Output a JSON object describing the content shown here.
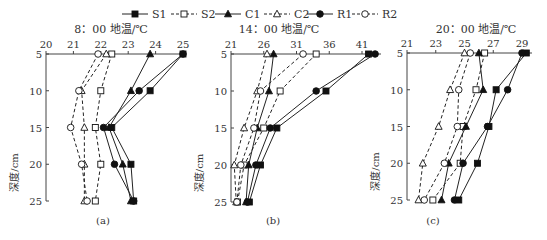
{
  "legend": [
    {
      "name": "S1",
      "marker": "square-filled",
      "dash": false
    },
    {
      "name": "S2",
      "marker": "square-open",
      "dash": true
    },
    {
      "name": "C1",
      "marker": "triangle-filled",
      "dash": false
    },
    {
      "name": "C2",
      "marker": "triangle-open",
      "dash": true
    },
    {
      "name": "R1",
      "marker": "circle-filled",
      "dash": false
    },
    {
      "name": "R2",
      "marker": "circle-open",
      "dash": true
    }
  ],
  "ylabel": "深度/cm",
  "chart_data": [
    {
      "type": "line",
      "caption": "(a)",
      "title": "8：00 地温/℃",
      "xlabel": "地温/℃",
      "ylabel": "深度/cm",
      "x_ticks": [
        20,
        21,
        22,
        23,
        24,
        25
      ],
      "xlim": [
        20,
        25
      ],
      "y_ticks": [
        5,
        10,
        15,
        20,
        25
      ],
      "ylim": [
        5,
        25
      ],
      "depths": [
        5,
        10,
        15,
        20,
        25
      ],
      "series": [
        {
          "name": "S1",
          "values": [
            25.0,
            23.8,
            22.4,
            23.1,
            23.2
          ]
        },
        {
          "name": "S2",
          "values": [
            22.4,
            22.0,
            21.8,
            22.0,
            21.8
          ]
        },
        {
          "name": "C1",
          "values": [
            23.8,
            23.1,
            22.3,
            22.8,
            23.1
          ]
        },
        {
          "name": "C2",
          "values": [
            22.2,
            21.3,
            21.4,
            21.4,
            21.4
          ]
        },
        {
          "name": "R1",
          "values": [
            25.0,
            23.4,
            22.1,
            22.5,
            23.2
          ]
        },
        {
          "name": "R2",
          "values": [
            21.9,
            21.2,
            20.9,
            21.3,
            21.5
          ]
        }
      ]
    },
    {
      "type": "line",
      "caption": "(b)",
      "title": "14：00 地温/℃",
      "xlabel": "地温/℃",
      "ylabel": "深度/cm",
      "x_ticks": [
        21,
        26,
        31,
        36,
        41
      ],
      "xlim": [
        21,
        44
      ],
      "y_ticks": [
        5,
        10,
        15,
        20,
        25
      ],
      "ylim": [
        5,
        25
      ],
      "depths": [
        5,
        10,
        15,
        20,
        25
      ],
      "series": [
        {
          "name": "S1",
          "values": [
            42.0,
            35.5,
            28.0,
            25.5,
            23.8
          ]
        },
        {
          "name": "S2",
          "values": [
            34.0,
            28.5,
            26.0,
            23.0,
            22.0
          ]
        },
        {
          "name": "C1",
          "values": [
            27.5,
            26.8,
            25.0,
            23.7,
            23.3
          ]
        },
        {
          "name": "C2",
          "values": [
            26.5,
            25.0,
            23.0,
            21.5,
            21.8
          ]
        },
        {
          "name": "R1",
          "values": [
            43.0,
            34.0,
            27.0,
            24.8,
            23.5
          ]
        },
        {
          "name": "R2",
          "values": [
            32.0,
            25.5,
            24.5,
            22.5,
            21.9
          ]
        }
      ]
    },
    {
      "type": "line",
      "caption": "(c)",
      "title": "20：00 地温/℃",
      "xlabel": "地温/℃",
      "ylabel": "深度/cm",
      "x_ticks": [
        21,
        23,
        25,
        27,
        29
      ],
      "xlim": [
        21,
        29.6
      ],
      "y_ticks": [
        5,
        10,
        15,
        20,
        25
      ],
      "ylim": [
        5,
        25
      ],
      "depths": [
        5,
        10,
        15,
        20,
        25
      ],
      "series": [
        {
          "name": "S1",
          "values": [
            29.3,
            27.2,
            26.7,
            25.9,
            24.6
          ]
        },
        {
          "name": "S2",
          "values": [
            26.4,
            25.8,
            24.9,
            24.7,
            22.8
          ]
        },
        {
          "name": "C1",
          "values": [
            26.0,
            26.3,
            25.1,
            23.9,
            23.4
          ]
        },
        {
          "name": "C2",
          "values": [
            25.0,
            24.0,
            23.2,
            22.1,
            21.8
          ]
        },
        {
          "name": "R1",
          "values": [
            29.0,
            28.0,
            26.6,
            24.9,
            24.3
          ]
        },
        {
          "name": "R2",
          "values": [
            25.4,
            24.6,
            24.5,
            23.6,
            22.2
          ]
        }
      ]
    }
  ]
}
